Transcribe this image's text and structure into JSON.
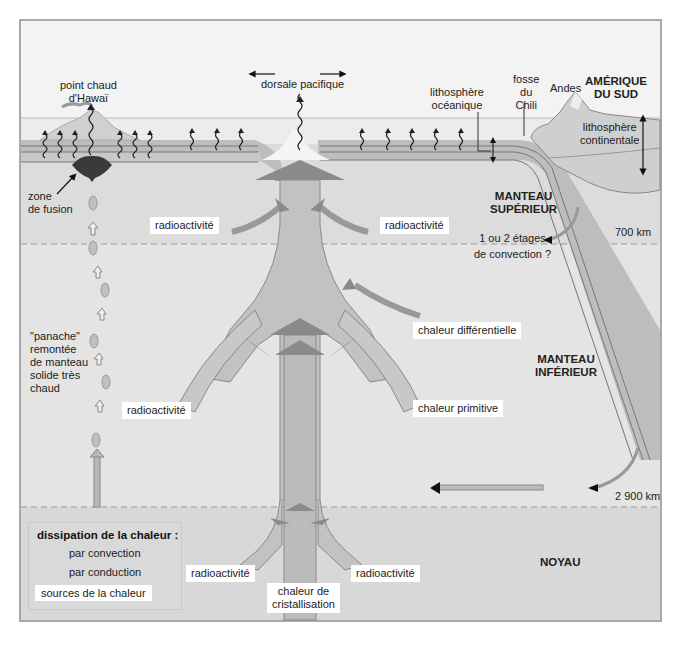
{
  "figure": {
    "colors": {
      "sky": "#f2f2f2",
      "ocean_water": "#ececec",
      "lithosphere": "#bdbdbd",
      "upper_mantle": "#dcdcdc",
      "lower_mantle": "#e3e3e3",
      "core": "#d7d7d7",
      "plume_arrow": "#b5b5b5",
      "arrow_head": "#8a8a8a",
      "frame": "#8f8f8f"
    },
    "surface_labels": {
      "hotspot": [
        "point chaud",
        "d'Hawaï"
      ],
      "ridge": "dorsale pacifique",
      "oceanic_lithosphere": [
        "lithosphère",
        "océanique"
      ],
      "trench": [
        "fosse",
        "du",
        "Chili"
      ],
      "andes": "Andes",
      "continent": [
        "AMÉRIQUE",
        "DU SUD"
      ],
      "continental_lithosphere": [
        "lithosphère",
        "continentale"
      ]
    },
    "layers": {
      "upper_mantle": [
        "MANTEAU",
        "SUPÉRIEUR"
      ],
      "lower_mantle": [
        "MANTEAU",
        "INFÉRIEUR"
      ],
      "core": "NOYAU"
    },
    "depths": {
      "d700": "700 km",
      "d2900": "2 900 km"
    },
    "annotations": {
      "zone_fusion": [
        "zone",
        "de fusion"
      ],
      "plume": [
        "\"panache\"",
        "remontée",
        "de manteau",
        "solide très",
        "chaud"
      ],
      "convection_question": [
        "1 ou 2 étages",
        "de convection ?"
      ]
    },
    "heat_sources": {
      "radio_upper_left": "radioactivité",
      "radio_upper_right": "radioactivité",
      "differential": "chaleur différentielle",
      "radio_mid_left": "radioactivité",
      "primitive": "chaleur primitive",
      "radio_core_left": "radioactivité",
      "radio_core_right": "radioactivité",
      "crystallisation": [
        "chaleur de",
        "cristallisation"
      ]
    },
    "legend": {
      "title": "dissipation de la chaleur :",
      "convection": "par convection",
      "conduction": "par conduction",
      "sources": "sources de la chaleur"
    }
  }
}
